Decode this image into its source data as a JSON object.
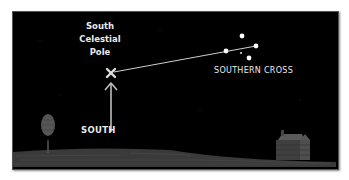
{
  "illustration": {
    "pole_label_lines": [
      "South",
      "Celestial",
      "Pole"
    ],
    "constellation_label": "SOUTHERN CROSS",
    "direction_label": "SOUTH",
    "colors": {
      "sky": "#000000",
      "ground": "#3a3a3a",
      "text": "#eaeaea",
      "stars": "#ffffff",
      "pointer_line": "#cfcfcf",
      "tree": "#555555",
      "cabin": "#4a4a4a"
    }
  }
}
